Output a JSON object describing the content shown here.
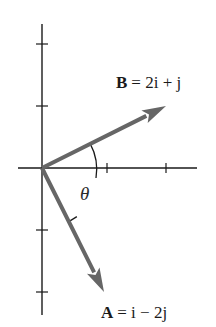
{
  "diagram": {
    "vector_b": {
      "name": "B",
      "i": 2,
      "j": 1,
      "label_lhs": "B",
      "label_rhs": "= 2i + j"
    },
    "vector_a": {
      "name": "A",
      "i": 1,
      "j": -2,
      "label_lhs": "A",
      "label_rhs": "= i − 2j"
    },
    "angle_label": "θ",
    "x_ticks": [
      1,
      2
    ],
    "y_ticks": [
      -2,
      -1,
      1,
      2
    ],
    "colors": {
      "axis": "#1a1a1a",
      "vector": "#666666",
      "text": "#1a1a1a"
    }
  }
}
